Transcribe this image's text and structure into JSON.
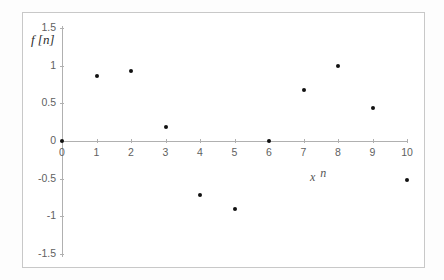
{
  "chart_data": {
    "type": "scatter",
    "title": "",
    "xlabel": "x n",
    "ylabel": "f [n]",
    "x": [
      0,
      1,
      2,
      3,
      4,
      5,
      6,
      7,
      8,
      9,
      10
    ],
    "values": [
      0,
      0.86,
      0.93,
      0.19,
      -0.72,
      -0.9,
      0,
      0.68,
      1.0,
      0.44,
      -0.52
    ],
    "series": [
      {
        "name": "f [n]",
        "values": [
          0,
          0.86,
          0.93,
          0.19,
          -0.72,
          -0.9,
          0,
          0.68,
          1.0,
          0.44,
          -0.52
        ]
      }
    ],
    "xlim": [
      0,
      10
    ],
    "ylim": [
      -1.5,
      1.5
    ],
    "x_ticks": [
      "0",
      "1",
      "2",
      "3",
      "4",
      "5",
      "6",
      "7",
      "8",
      "9",
      "10"
    ],
    "y_ticks": [
      "1.5",
      "1",
      "0.5",
      "0",
      "-0.5",
      "-1",
      "-1.5"
    ],
    "y_tick_values": [
      1.5,
      1,
      0.5,
      0,
      -0.5,
      -1,
      -1.5
    ],
    "grid": false,
    "legend": "none",
    "marker": "filled-circle",
    "marker_color": "#111111",
    "axis_color": "#b0b0b0",
    "frame_color": "#c8c8c8",
    "background": "#ffffff"
  },
  "labels": {
    "y_axis_title": "f [n]",
    "x_axis_title_main": "x",
    "x_axis_title_sub": "n"
  }
}
